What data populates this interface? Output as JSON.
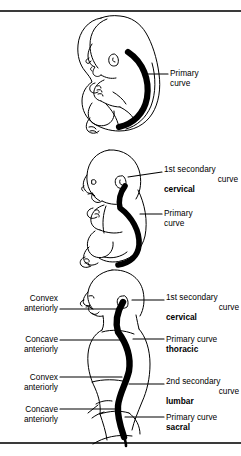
{
  "figure": {
    "background": "#ffffff",
    "ink": "#000000",
    "panels": [
      {
        "id": "fetal",
        "subject": "curled fetus in utero, lateral view, spine forms a single C-shaped primary curve",
        "labels_right": [
          {
            "lines": [
              "Primary",
              "curve"
            ],
            "bold_line": null
          }
        ],
        "labels_left": []
      },
      {
        "id": "infant",
        "subject": "seated infant, lateral view, cervical secondary curve has appeared above the primary thoracic curve",
        "labels_right": [
          {
            "lines": [
              "1st secondary",
              "curve",
              "cervical"
            ],
            "bold_line": "cervical"
          },
          {
            "lines": [
              "Primary",
              "curve"
            ],
            "bold_line": null
          }
        ],
        "labels_left": []
      },
      {
        "id": "adult",
        "subject": "standing adult facing left, lateral view, spine shows full S-shaped set of four curvatures",
        "labels_right": [
          {
            "lines": [
              "1st secondary",
              "curve",
              "cervical"
            ],
            "bold_line": "cervical"
          },
          {
            "lines": [
              "Primary curve",
              "thoracic"
            ],
            "bold_line": "thoracic"
          },
          {
            "lines": [
              "2nd secondary",
              "curve",
              "lumbar"
            ],
            "bold_line": "lumbar"
          },
          {
            "lines": [
              "Primary curve",
              "sacral"
            ],
            "bold_line": "sacral"
          }
        ],
        "labels_left": [
          {
            "lines": [
              "Convex",
              "anteriorly"
            ]
          },
          {
            "lines": [
              "Concave",
              "anteriorly"
            ]
          },
          {
            "lines": [
              "Convex",
              "anteriorly"
            ]
          },
          {
            "lines": [
              "Concave",
              "anteriorly"
            ]
          }
        ]
      }
    ],
    "text": {
      "primary": "Primary",
      "curve": "curve",
      "primary_curve": "Primary curve",
      "first_secondary": "1st secondary",
      "second_secondary": "2nd secondary",
      "cervical": "cervical",
      "thoracic": "thoracic",
      "lumbar": "lumbar",
      "sacral": "sacral",
      "convex": "Convex",
      "concave": "Concave",
      "anteriorly": "anteriorly"
    }
  }
}
